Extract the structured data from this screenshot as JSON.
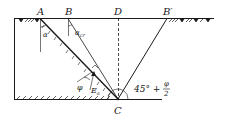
{
  "diagram": {
    "type": "soil-mechanics-earth-pressure",
    "points": {
      "A": "A",
      "B": "B",
      "D": "D",
      "B_prime": "B′",
      "C": "C"
    },
    "angles": {
      "alpha": "α",
      "alpha_cr": "α",
      "alpha_cr_sub": "cr",
      "phi": "φ",
      "failure_angle_prefix": "45° +",
      "failure_angle_num": "φ",
      "failure_angle_den": "2"
    },
    "force": {
      "symbol": "E",
      "subscript": "a",
      "prime": "′"
    },
    "colors": {
      "line": "#1a1a1a",
      "background": "#ffffff"
    }
  }
}
